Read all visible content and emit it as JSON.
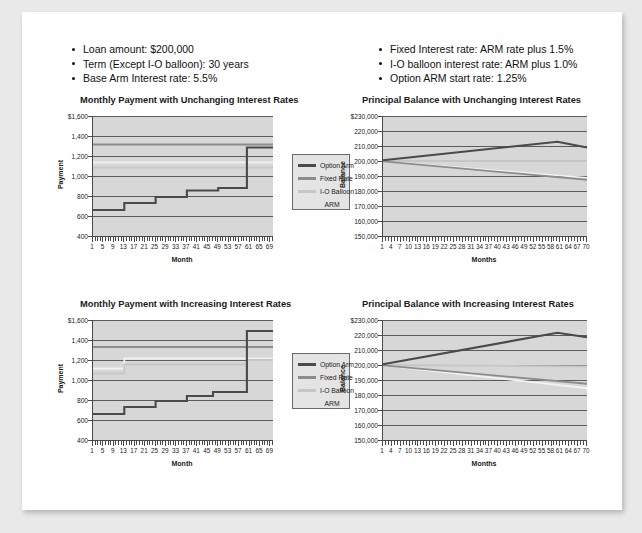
{
  "document": {
    "background_color": "#e9e9e9",
    "sheet_color": "#ffffff"
  },
  "assumptions_left": {
    "items": [
      "Loan amount: $200,000",
      "Term (Except I-O balloon): 30 years",
      "Base Arm Interest rate: 5.5%"
    ]
  },
  "assumptions_right": {
    "items": [
      "Fixed Interest rate: ARM rate plus 1.5%",
      "I-O balloon interest rate: ARM plus 1.0%",
      "Option ARM start rate: 1.25%"
    ]
  },
  "legend": {
    "entries": [
      {
        "label": "Option Arm",
        "color": "#4a4a4a"
      },
      {
        "label": "Fixed Rate",
        "color": "#8c8c8c"
      },
      {
        "label": "I-O Balloon",
        "color": "#c6c6c6"
      },
      {
        "label": "ARM",
        "color": "#e9e9e9"
      }
    ]
  },
  "colors": {
    "option_arm": "#4a4a4a",
    "fixed_rate": "#8c8c8c",
    "io_balloon": "#c6c6c6",
    "arm": "#f2f2f2",
    "plot_background": "#d7d7d7",
    "gridline": "#5c5c5c",
    "axis": "#4a4a4a"
  },
  "chart_data": [
    {
      "id": "payment-unchanging",
      "type": "line",
      "title": "Monthly Payment with Unchanging Interest Rates",
      "xlabel": "Month",
      "ylabel": "Payment",
      "ylim": [
        400,
        1600
      ],
      "yticks": [
        400,
        600,
        800,
        1000,
        1200,
        1400,
        1600
      ],
      "ytick_labels": [
        "400",
        "600",
        "800",
        "1,000",
        "1,200",
        "1,400",
        "$1,600"
      ],
      "xlim": [
        1,
        70
      ],
      "xticks": [
        1,
        5,
        9,
        13,
        17,
        21,
        25,
        29,
        33,
        37,
        41,
        45,
        49,
        53,
        57,
        61,
        65,
        69
      ],
      "xtick_labels": [
        "1",
        "5",
        "9",
        "13",
        "17",
        "21",
        "25",
        "29",
        "33",
        "37",
        "41",
        "45",
        "49",
        "53",
        "57",
        "61",
        "65",
        "69"
      ],
      "grid": true,
      "legend_position": "right",
      "series": [
        {
          "name": "Option Arm",
          "color": "#4a4a4a",
          "step": true,
          "x": [
            1,
            13,
            13,
            25,
            25,
            37,
            37,
            49,
            49,
            60,
            60,
            70
          ],
          "y": [
            660,
            660,
            730,
            730,
            790,
            790,
            855,
            855,
            880,
            880,
            1285,
            1285
          ]
        },
        {
          "name": "Fixed Rate",
          "color": "#8c8c8c",
          "step": false,
          "x": [
            1,
            70
          ],
          "y": [
            1315,
            1315
          ]
        },
        {
          "name": "I-O Balloon",
          "color": "#c6c6c6",
          "step": false,
          "x": [
            1,
            70
          ],
          "y": [
            1083,
            1083
          ]
        },
        {
          "name": "ARM",
          "color": "#f2f2f2",
          "step": false,
          "x": [
            1,
            70
          ],
          "y": [
            1136,
            1136
          ]
        }
      ]
    },
    {
      "id": "balance-unchanging",
      "type": "line",
      "title": "Principal Balance with Unchanging Interest Rates",
      "xlabel": "Months",
      "ylabel": "Balance",
      "ylim": [
        150000,
        230000
      ],
      "yticks": [
        150000,
        160000,
        170000,
        180000,
        190000,
        200000,
        210000,
        220000,
        230000
      ],
      "ytick_labels": [
        "150,000",
        "160,000",
        "170,000",
        "180,000",
        "190,000",
        "200,000",
        "210,000",
        "220,000",
        "$230,000"
      ],
      "xlim": [
        1,
        70
      ],
      "xticks": [
        1,
        4,
        7,
        10,
        13,
        16,
        19,
        22,
        25,
        28,
        31,
        34,
        37,
        40,
        43,
        46,
        49,
        52,
        55,
        58,
        61,
        64,
        67,
        70
      ],
      "xtick_labels": [
        "1",
        "4",
        "7",
        "10",
        "13",
        "16",
        "19",
        "22",
        "25",
        "28",
        "31",
        "34",
        "37",
        "40",
        "43",
        "46",
        "49",
        "52",
        "55",
        "58",
        "61",
        "64",
        "67",
        "70"
      ],
      "grid": true,
      "legend_position": "none",
      "series": [
        {
          "name": "Option Arm",
          "color": "#4a4a4a",
          "step": false,
          "x": [
            1,
            60,
            70
          ],
          "y": [
            200500,
            212800,
            209000
          ]
        },
        {
          "name": "Fixed Rate",
          "color": "#8c8c8c",
          "step": false,
          "x": [
            1,
            70
          ],
          "y": [
            199800,
            187500
          ]
        },
        {
          "name": "I-O Balloon",
          "color": "#c6c6c6",
          "step": false,
          "x": [
            1,
            70
          ],
          "y": [
            200000,
            200000
          ]
        },
        {
          "name": "ARM",
          "color": "#f2f2f2",
          "step": false,
          "x": [
            1,
            70
          ],
          "y": [
            199800,
            188800
          ]
        }
      ]
    },
    {
      "id": "payment-increasing",
      "type": "line",
      "title": "Monthly Payment with Increasing Interest Rates",
      "xlabel": "Month",
      "ylabel": "Payment",
      "ylim": [
        400,
        1600
      ],
      "yticks": [
        400,
        600,
        800,
        1000,
        1200,
        1400,
        1600
      ],
      "ytick_labels": [
        "400",
        "600",
        "800",
        "1,000",
        "1,200",
        "1,400",
        "$1,600"
      ],
      "xlim": [
        1,
        70
      ],
      "xticks": [
        1,
        5,
        9,
        13,
        17,
        21,
        25,
        29,
        33,
        37,
        41,
        45,
        49,
        53,
        57,
        61,
        65,
        69
      ],
      "xtick_labels": [
        "1",
        "5",
        "9",
        "13",
        "17",
        "21",
        "25",
        "29",
        "33",
        "37",
        "41",
        "45",
        "49",
        "53",
        "57",
        "61",
        "65",
        "69"
      ],
      "grid": true,
      "legend_position": "right",
      "series": [
        {
          "name": "Option Arm",
          "color": "#4a4a4a",
          "step": true,
          "x": [
            1,
            13,
            13,
            25,
            25,
            37,
            37,
            47,
            47,
            60,
            60,
            70
          ],
          "y": [
            660,
            660,
            730,
            730,
            790,
            790,
            840,
            840,
            880,
            880,
            1490,
            1490
          ]
        },
        {
          "name": "Fixed Rate",
          "color": "#8c8c8c",
          "step": false,
          "x": [
            1,
            70
          ],
          "y": [
            1330,
            1330
          ]
        },
        {
          "name": "I-O Balloon",
          "color": "#c6c6c6",
          "step": true,
          "x": [
            1,
            13,
            13,
            60,
            60,
            70
          ],
          "y": [
            1065,
            1065,
            1155,
            1155,
            1200,
            1200
          ]
        },
        {
          "name": "ARM",
          "color": "#f2f2f2",
          "step": true,
          "x": [
            1,
            13,
            13,
            60,
            60,
            70
          ],
          "y": [
            1115,
            1115,
            1215,
            1215,
            1215,
            1215
          ]
        }
      ]
    },
    {
      "id": "balance-increasing",
      "type": "line",
      "title": "Principal Balance with Increasing Interest Rates",
      "xlabel": "Months",
      "ylabel": "Balance",
      "ylim": [
        150000,
        230000
      ],
      "yticks": [
        150000,
        160000,
        170000,
        180000,
        190000,
        200000,
        210000,
        220000,
        230000
      ],
      "ytick_labels": [
        "150,000",
        "160,000",
        "170,000",
        "180,000",
        "190,000",
        "200,000",
        "210,000",
        "220,000",
        "$230,000"
      ],
      "xlim": [
        1,
        70
      ],
      "xticks": [
        1,
        4,
        7,
        10,
        13,
        16,
        19,
        22,
        25,
        28,
        31,
        34,
        37,
        40,
        43,
        46,
        49,
        52,
        55,
        58,
        61,
        64,
        67,
        70
      ],
      "xtick_labels": [
        "1",
        "4",
        "7",
        "10",
        "13",
        "16",
        "19",
        "22",
        "25",
        "28",
        "31",
        "34",
        "37",
        "40",
        "43",
        "46",
        "49",
        "52",
        "55",
        "58",
        "61",
        "64",
        "67",
        "70"
      ],
      "grid": true,
      "legend_position": "none",
      "series": [
        {
          "name": "Option Arm",
          "color": "#4a4a4a",
          "step": false,
          "x": [
            1,
            60,
            70
          ],
          "y": [
            200500,
            221500,
            218500
          ]
        },
        {
          "name": "Fixed Rate",
          "color": "#8c8c8c",
          "step": false,
          "x": [
            1,
            70
          ],
          "y": [
            199800,
            187500
          ]
        },
        {
          "name": "I-O Balloon",
          "color": "#c6c6c6",
          "step": false,
          "x": [
            1,
            70
          ],
          "y": [
            200000,
            199000
          ]
        },
        {
          "name": "ARM",
          "color": "#f2f2f2",
          "step": false,
          "x": [
            1,
            70
          ],
          "y": [
            199800,
            184500
          ]
        }
      ]
    }
  ]
}
